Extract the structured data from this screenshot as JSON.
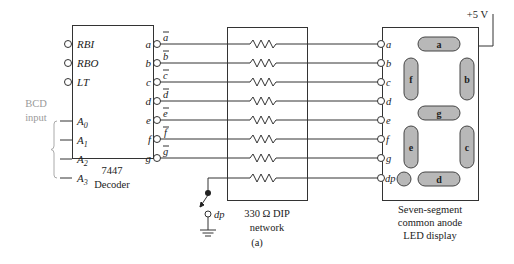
{
  "decoder": {
    "part": "7447",
    "name": "Decoder",
    "control_inputs": [
      "RBI",
      "RBO",
      "LT"
    ],
    "bcd_inputs": [
      {
        "base": "A",
        "sub": "0"
      },
      {
        "base": "A",
        "sub": "1"
      },
      {
        "base": "A",
        "sub": "2"
      },
      {
        "base": "A",
        "sub": "3"
      }
    ],
    "bcd_label_line1": "BCD",
    "bcd_label_line2": "input",
    "outputs": [
      "a",
      "b",
      "c",
      "d",
      "e",
      "f",
      "g"
    ],
    "output_signals": [
      "a",
      "b",
      "c",
      "d",
      "e",
      "f",
      "g"
    ]
  },
  "resistor_network": {
    "label_line1": "330 Ω DIP",
    "label_line2": "network",
    "count": 8
  },
  "switch": {
    "label": "dp"
  },
  "display": {
    "supply": "+5 V",
    "pins": [
      "a",
      "b",
      "c",
      "d",
      "e",
      "f",
      "g",
      "dp"
    ],
    "segments": [
      "a",
      "b",
      "c",
      "d",
      "e",
      "f",
      "g"
    ],
    "label_line1": "Seven-segment",
    "label_line2": "common anode",
    "label_line3": "LED display"
  },
  "caption": "(a)"
}
